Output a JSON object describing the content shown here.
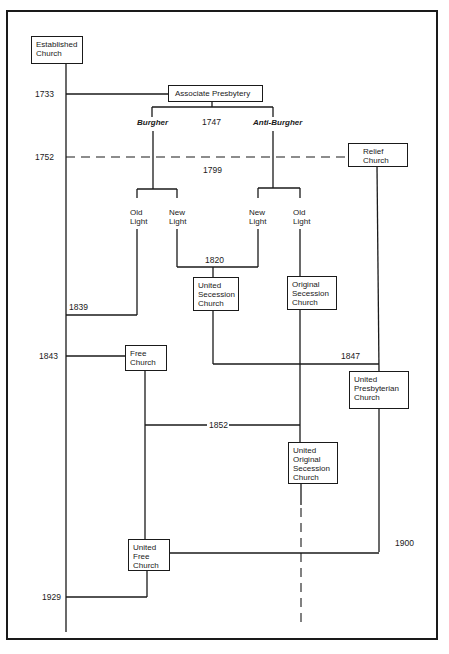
{
  "diagram": {
    "boxes": {
      "established_church": "Established\nChurch",
      "associate_presbytery": "Associate Presbytery",
      "relief_church": "Relief\nChurch",
      "united_secession_church": "United\nSecession\nChurch",
      "original_secession_church": "Original\nSecession\nChurch",
      "free_church": "Free\nChurch",
      "united_presbyterian_church": "United\nPresbyterian\nChurch",
      "united_original_secession_church": "United\nOriginal\nSecession\nChurch",
      "united_free_church": "United\nFree\nChurch"
    },
    "branch_labels": {
      "burgher": "Burgher",
      "anti_burgher": "Anti-Burgher",
      "burgher_old_light": "Old\nLight",
      "burgher_new_light": "New\nLight",
      "anti_burgher_new_light": "New\nLight",
      "anti_burgher_old_light": "Old\nLight"
    },
    "years": {
      "y1733": "1733",
      "y1747": "1747",
      "y1752": "1752",
      "y1799": "1799",
      "y1820": "1820",
      "y1839": "1839",
      "y1843": "1843",
      "y1847": "1847",
      "y1852": "1852",
      "y1900": "1900",
      "y1929": "1929"
    },
    "colors": {
      "ink": "#1a1a1a",
      "background": "#ffffff"
    }
  }
}
